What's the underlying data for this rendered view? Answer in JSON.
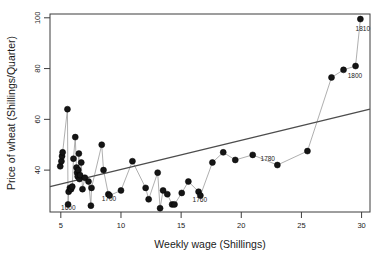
{
  "chart_data": {
    "type": "scatter",
    "title": "",
    "xlabel": "Weekly wage (Shillings)",
    "ylabel": "Price of wheat (Shillings/Quarter)",
    "xlim": [
      4.1,
      30.7
    ],
    "ylim": [
      23.5,
      101.5
    ],
    "xticks": [
      5,
      10,
      15,
      20,
      25,
      30
    ],
    "yticks": [
      40,
      60,
      80,
      100
    ],
    "grid": false,
    "legend": null,
    "series": [
      {
        "name": "Wheat price vs weekly wage",
        "marker": "filled-circle",
        "marker_color": "#151515",
        "connector": "line",
        "connector_color": "#9a9a9a",
        "x": [
          4.95,
          5.05,
          5.1,
          5.15,
          5.55,
          5.6,
          5.65,
          5.75,
          5.85,
          5.95,
          6.05,
          6.2,
          6.3,
          6.35,
          6.4,
          6.45,
          6.5,
          6.55,
          6.6,
          6.7,
          6.8,
          7.0,
          7.3,
          7.5,
          7.55,
          8.4,
          8.55,
          8.95,
          9.05,
          10.0,
          10.95,
          12.05,
          12.3,
          13.05,
          13.25,
          13.5,
          13.85,
          14.25,
          14.45,
          15.05,
          15.6,
          16.45,
          16.6,
          17.6,
          18.5,
          19.5,
          20.95,
          23.0,
          25.5,
          27.5,
          28.5,
          29.5,
          29.9
        ],
        "y": [
          41.5,
          43.5,
          45.5,
          47.0,
          64.0,
          26.5,
          31.5,
          33.0,
          32.5,
          33.5,
          44.5,
          53.0,
          41.0,
          39.0,
          37.5,
          40.0,
          46.5,
          36.5,
          38.0,
          43.0,
          32.5,
          37.0,
          35.5,
          26.0,
          33.0,
          50.0,
          40.0,
          30.5,
          30.0,
          32.0,
          43.5,
          33.0,
          28.5,
          39.0,
          25.0,
          32.0,
          30.5,
          26.5,
          26.5,
          31.0,
          35.5,
          31.5,
          30.0,
          43.0,
          47.0,
          44.0,
          46.0,
          42.0,
          47.5,
          76.5,
          79.5,
          81.0,
          99.5
        ]
      }
    ],
    "trendline": {
      "name": "linear fit",
      "color": "#4d4d4d",
      "x_start": 4.1,
      "y_start": 33.5,
      "x_end": 30.7,
      "y_end": 64.0
    },
    "annotations": [
      {
        "label": "1600",
        "x": 5.62,
        "y": 24.2,
        "anchor": "middle"
      },
      {
        "label": "1700",
        "x": 9.0,
        "y": 27.9,
        "anchor": "middle"
      },
      {
        "label": "1760",
        "x": 16.55,
        "y": 27.6,
        "anchor": "middle"
      },
      {
        "label": "1780",
        "x": 21.6,
        "y": 43.4,
        "anchor": "start"
      },
      {
        "label": "1800",
        "x": 28.85,
        "y": 76.4,
        "anchor": "start"
      },
      {
        "label": "1810",
        "x": 30.1,
        "y": 95.0,
        "anchor": "middle"
      }
    ]
  }
}
